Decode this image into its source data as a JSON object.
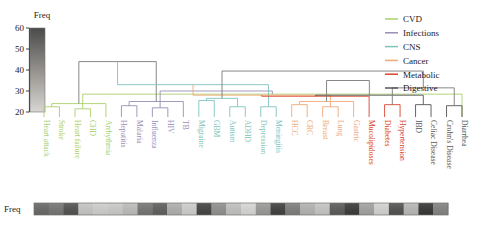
{
  "figure": {
    "colorbar_title": "Freq",
    "bottom_strip_label": "Freq",
    "caption": "",
    "background": "#ffffff"
  },
  "axis": {
    "ticks": [
      "60",
      "50",
      "40",
      "30",
      "20"
    ],
    "tick_values": [
      60,
      50,
      40,
      30,
      20
    ],
    "ymin": 20,
    "ymax": 60
  },
  "legend": {
    "items": [
      {
        "label": "CVD",
        "color": "#a9cf6a"
      },
      {
        "label": "Infections",
        "color": "#9a8fb5"
      },
      {
        "label": "CNS",
        "color": "#7fc4bd"
      },
      {
        "label": "Cancer",
        "color": "#f0a878"
      },
      {
        "label": "Metabolic",
        "color": "#d9442e"
      },
      {
        "label": "Digestive",
        "color": "#555555"
      }
    ]
  },
  "colorbar": {
    "title": "Freq",
    "top_color": "#4a4a4a",
    "bottom_color": "#d6d4d0"
  },
  "chart_data": {
    "type": "dendrogram",
    "title": "",
    "xlabel": "",
    "ylabel": "Freq",
    "ylim": [
      20,
      60
    ],
    "grid": false,
    "legend_position": "top-right",
    "groups": [
      {
        "name": "CVD",
        "color": "#a9cf6a",
        "leaves": [
          "Heart attack",
          "Stroke",
          "Heart failure",
          "CHD",
          "Arrhythmia"
        ]
      },
      {
        "name": "Infections",
        "color": "#9a8fb5",
        "leaves": [
          "Hepatitis",
          "Malaria",
          "Influenza",
          "HIV",
          "TB"
        ]
      },
      {
        "name": "CNS",
        "color": "#7fc4bd",
        "leaves": [
          "Migraine",
          "GBM",
          "Autism",
          "ADHD",
          "Depression",
          "Meningitis"
        ]
      },
      {
        "name": "Cancer",
        "color": "#f0a878",
        "leaves": [
          "HCC",
          "CRC",
          "Breast",
          "Lung",
          "Gastric"
        ]
      },
      {
        "name": "Metabolic",
        "color": "#d9442e",
        "leaves": [
          "Mucolipidoses",
          "Diabetes",
          "Hypertension"
        ]
      },
      {
        "name": "Digestive",
        "color": "#555555",
        "leaves": [
          "IBD",
          "Celiac Disease",
          "Crohn's Disease",
          "Diarrhea"
        ]
      }
    ],
    "leaves": [
      {
        "label": "Heart attack",
        "group": "CVD",
        "color": "#a9cf6a",
        "freq": 47
      },
      {
        "label": "Stroke",
        "group": "CVD",
        "color": "#a9cf6a",
        "freq": 44
      },
      {
        "label": "Heart failure",
        "group": "CVD",
        "color": "#a9cf6a",
        "freq": 52
      },
      {
        "label": "CHD",
        "group": "CVD",
        "color": "#a9cf6a",
        "freq": 26
      },
      {
        "label": "Arrhythmia",
        "group": "CVD",
        "color": "#a9cf6a",
        "freq": 24
      },
      {
        "label": "Hepatitis",
        "group": "Infections",
        "color": "#9a8fb5",
        "freq": 25
      },
      {
        "label": "Malaria",
        "group": "Infections",
        "color": "#9a8fb5",
        "freq": 28
      },
      {
        "label": "Influenza",
        "group": "Infections",
        "color": "#9a8fb5",
        "freq": 44
      },
      {
        "label": "HIV",
        "group": "Infections",
        "color": "#9a8fb5",
        "freq": 49
      },
      {
        "label": "TB",
        "group": "Infections",
        "color": "#9a8fb5",
        "freq": 31
      },
      {
        "label": "Migraine",
        "group": "CNS",
        "color": "#7fc4bd",
        "freq": 24
      },
      {
        "label": "GBM",
        "group": "CNS",
        "color": "#7fc4bd",
        "freq": 55
      },
      {
        "label": "Autism",
        "group": "CNS",
        "color": "#7fc4bd",
        "freq": 38
      },
      {
        "label": "ADHD",
        "group": "CNS",
        "color": "#7fc4bd",
        "freq": 27
      },
      {
        "label": "Depression",
        "group": "CNS",
        "color": "#7fc4bd",
        "freq": 22
      },
      {
        "label": "Meningitis",
        "group": "CNS",
        "color": "#7fc4bd",
        "freq": 36
      },
      {
        "label": "HCC",
        "group": "Cancer",
        "color": "#f0a878",
        "freq": 56
      },
      {
        "label": "CRC",
        "group": "Cancer",
        "color": "#f0a878",
        "freq": 42
      },
      {
        "label": "Breast",
        "group": "Cancer",
        "color": "#f0a878",
        "freq": 30
      },
      {
        "label": "Lung",
        "group": "Cancer",
        "color": "#f0a878",
        "freq": 26
      },
      {
        "label": "Gastric",
        "group": "Cancer",
        "color": "#f0a878",
        "freq": 50
      },
      {
        "label": "Mucolipidoses",
        "group": "Metabolic",
        "color": "#d9442e",
        "freq": 57
      },
      {
        "label": "Diabetes",
        "group": "Metabolic",
        "color": "#d9442e",
        "freq": 34
      },
      {
        "label": "Hypertension",
        "group": "Metabolic",
        "color": "#d9442e",
        "freq": 23
      },
      {
        "label": "IBD",
        "group": "Digestive",
        "color": "#555555",
        "freq": 52
      },
      {
        "label": "Celiac Disease",
        "group": "Digestive",
        "color": "#555555",
        "freq": 29
      },
      {
        "label": "Crohn's Disease",
        "group": "Digestive",
        "color": "#555555",
        "freq": 58
      },
      {
        "label": "Diarrhea",
        "group": "Digestive",
        "color": "#555555",
        "freq": 41
      }
    ],
    "merges": [
      {
        "left": 0,
        "right": 1,
        "height": 22.5,
        "color": "#a9cf6a"
      },
      {
        "left": 2,
        "right": 3,
        "height": 21.5,
        "color": "#a9cf6a"
      },
      {
        "left": 28,
        "right": 4,
        "height": 24.0,
        "color": "#a9cf6a"
      },
      {
        "left": 27,
        "right": 29,
        "height": 28.5,
        "color": "#a9cf6a"
      },
      {
        "left": 5,
        "right": 6,
        "height": 23.0,
        "color": "#9a8fb5"
      },
      {
        "left": 7,
        "right": 8,
        "height": 22.0,
        "color": "#9a8fb5"
      },
      {
        "left": 32,
        "right": 9,
        "height": 25.0,
        "color": "#9a8fb5"
      },
      {
        "left": 31,
        "right": 33,
        "height": 30.0,
        "color": "#9a8fb5"
      },
      {
        "left": 30,
        "right": 34,
        "height": 44.0,
        "color": "#7a7a7a"
      },
      {
        "left": 10,
        "right": 11,
        "height": 25.5,
        "color": "#7fc4bd"
      },
      {
        "left": 12,
        "right": 13,
        "height": 22.5,
        "color": "#7fc4bd"
      },
      {
        "left": 14,
        "right": 15,
        "height": 22.5,
        "color": "#7fc4bd"
      },
      {
        "left": 37,
        "right": 38,
        "height": 26.5,
        "color": "#7fc4bd"
      },
      {
        "left": 36,
        "right": 39,
        "height": 33.0,
        "color": "#7fc4bd"
      },
      {
        "left": 16,
        "right": 17,
        "height": 23.5,
        "color": "#f0a878"
      },
      {
        "left": 18,
        "right": 19,
        "height": 22.5,
        "color": "#f0a878"
      },
      {
        "left": 42,
        "right": 20,
        "height": 25.0,
        "color": "#f0a878"
      },
      {
        "left": 41,
        "right": 43,
        "height": 28.0,
        "color": "#f0a878"
      },
      {
        "left": 22,
        "right": 23,
        "height": 23.5,
        "color": "#d9442e"
      },
      {
        "left": 21,
        "right": 45,
        "height": 27.5,
        "color": "#d9442e"
      },
      {
        "left": 24,
        "right": 25,
        "height": 23.5,
        "color": "#555555"
      },
      {
        "left": 26,
        "right": 27,
        "height": 23.0,
        "color": "#555555"
      },
      {
        "left": 47,
        "right": 48,
        "height": 28.0,
        "color": "#555555"
      },
      {
        "left": 46,
        "right": 49,
        "height": 31.5,
        "color": "#7a7a7a"
      },
      {
        "left": 44,
        "right": 50,
        "height": 35.0,
        "color": "#7a7a7a"
      },
      {
        "left": 40,
        "right": 51,
        "height": 39.5,
        "color": "#7a7a7a"
      }
    ],
    "heatmap_strip": {
      "label": "Freq",
      "n_cells": 28,
      "values": [
        47,
        44,
        52,
        26,
        24,
        25,
        28,
        44,
        49,
        31,
        24,
        55,
        38,
        27,
        22,
        36,
        56,
        42,
        30,
        26,
        50,
        57,
        34,
        23,
        52,
        29,
        58,
        41
      ]
    }
  }
}
